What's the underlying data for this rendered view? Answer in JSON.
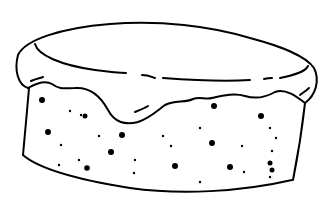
{
  "image": {
    "subject": "cake",
    "style": "line-drawing",
    "stroke_color": "#000000",
    "background_color": "#ffffff"
  }
}
